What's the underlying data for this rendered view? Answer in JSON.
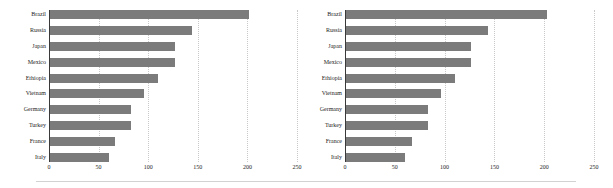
{
  "figure": {
    "background": "#ffffff",
    "bar_color": "#7b7b7b",
    "grid_color": "#c9c9c9",
    "axis_color": "#3a3a3a",
    "text_color": "#1d1d1d"
  },
  "chart_data": [
    {
      "type": "bar",
      "orientation": "horizontal",
      "title": "",
      "xlabel": "",
      "ylabel": "",
      "categories": [
        "Brazil",
        "Russia",
        "Japan",
        "Mexico",
        "Ethiopia",
        "Vietnam",
        "Germany",
        "Turkey",
        "France",
        "Italy"
      ],
      "values": [
        202,
        144,
        127,
        127,
        110,
        96,
        83,
        83,
        67,
        60
      ],
      "xlim": [
        0,
        250
      ],
      "xticks": [
        0,
        50,
        100,
        150,
        200,
        250
      ],
      "xticklabels": [
        "0",
        "50",
        "100",
        "150",
        "200",
        "250"
      ],
      "grid": true,
      "grid_axis": "x",
      "legend": false
    },
    {
      "type": "bar",
      "orientation": "horizontal",
      "title": "",
      "xlabel": "",
      "ylabel": "",
      "categories": [
        "Brazil",
        "Russia",
        "Japan",
        "Mexico",
        "Ethiopia",
        "Vietnam",
        "Germany",
        "Turkey",
        "France",
        "Italy"
      ],
      "values": [
        203,
        144,
        127,
        127,
        110,
        96,
        83,
        83,
        67,
        60
      ],
      "xlim": [
        0,
        250
      ],
      "xticks": [
        0,
        50,
        100,
        150,
        200,
        250
      ],
      "xticklabels": [
        "0",
        "50",
        "100",
        "150",
        "200",
        "250"
      ],
      "grid": true,
      "grid_axis": "x",
      "legend": false
    }
  ]
}
